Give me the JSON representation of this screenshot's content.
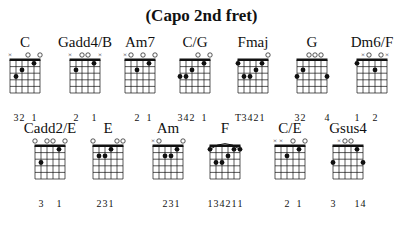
{
  "title": "(Capo 2nd fret)",
  "colors": {
    "ink": "#111111",
    "background": "#ffffff"
  },
  "chords": [
    {
      "name": "C",
      "x": -5,
      "y": 34,
      "strings": [
        "x",
        "3",
        "2",
        "o",
        "1",
        "o"
      ],
      "fingers": [
        "",
        "3",
        "2",
        "",
        "1",
        ""
      ],
      "barre": false
    },
    {
      "name": "Gadd4/B",
      "x": 55,
      "y": 34,
      "strings": [
        "x",
        "2",
        "o",
        "o",
        "1",
        "x"
      ],
      "fingers": [
        "",
        "2",
        "",
        "",
        "1",
        ""
      ],
      "barre": false
    },
    {
      "name": "Am7",
      "x": 110,
      "y": 34,
      "strings": [
        "x",
        "o",
        "2",
        "o",
        "1",
        "o"
      ],
      "fingers": [
        "",
        "",
        "2",
        "",
        "1",
        ""
      ],
      "barre": false
    },
    {
      "name": "C/G",
      "x": 165,
      "y": 34,
      "strings": [
        "3",
        "3",
        "2",
        "o",
        "1",
        "o"
      ],
      "fingers": [
        "3",
        "4",
        "2",
        "",
        "1",
        ""
      ],
      "barre": false
    },
    {
      "name": "Fmaj",
      "x": 223,
      "y": 34,
      "strings": [
        "1",
        "3",
        "3",
        "2",
        "1",
        "o"
      ],
      "fingers": [
        "T",
        "3",
        "4",
        "2",
        "1",
        ""
      ],
      "barre": false
    },
    {
      "name": "G",
      "x": 282,
      "y": 34,
      "strings": [
        "3",
        "2",
        "o",
        "o",
        "o",
        "3"
      ],
      "fingers": [
        "3",
        "2",
        "",
        "",
        "",
        "4"
      ],
      "barre": false
    },
    {
      "name": "Dm6/F",
      "x": 342,
      "y": 34,
      "strings": [
        "1",
        "x",
        "o",
        "2",
        "o",
        "x"
      ],
      "fingers": [
        "1",
        "",
        "",
        "2",
        "",
        ""
      ],
      "barre": false
    },
    {
      "name": "Cadd2/E",
      "x": 20,
      "y": 120,
      "strings": [
        "o",
        "3",
        "o",
        "o",
        "1",
        "o"
      ],
      "fingers": [
        "",
        "3",
        "",
        "",
        "1",
        ""
      ],
      "barre": false
    },
    {
      "name": "E",
      "x": 78,
      "y": 120,
      "strings": [
        "o",
        "2",
        "2",
        "1",
        "o",
        "o"
      ],
      "fingers": [
        "",
        "2",
        "3",
        "1",
        "",
        ""
      ],
      "barre": false
    },
    {
      "name": "Am",
      "x": 138,
      "y": 120,
      "strings": [
        "x",
        "o",
        "2",
        "2",
        "1",
        "o"
      ],
      "fingers": [
        "",
        "",
        "2",
        "3",
        "1",
        ""
      ],
      "barre": false
    },
    {
      "name": "F",
      "x": 195,
      "y": 120,
      "strings": [
        "1",
        "3",
        "3",
        "2",
        "1",
        "1"
      ],
      "fingers": [
        "1",
        "3",
        "4",
        "2",
        "1",
        "1"
      ],
      "barre": true
    },
    {
      "name": "C/E",
      "x": 260,
      "y": 120,
      "strings": [
        "x",
        "x",
        "2",
        "o",
        "1",
        "o"
      ],
      "fingers": [
        "",
        "",
        "2",
        "",
        "1",
        ""
      ],
      "barre": false
    },
    {
      "name": "Gsus4",
      "x": 318,
      "y": 120,
      "strings": [
        "3",
        "x",
        "o",
        "o",
        "1",
        "3"
      ],
      "fingers": [
        "3",
        "",
        "",
        "",
        "1",
        "4"
      ],
      "barre": false
    }
  ]
}
